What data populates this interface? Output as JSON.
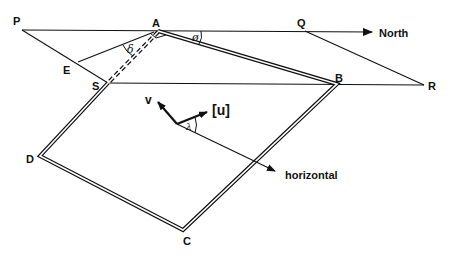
{
  "diagram": {
    "type": "geometry-orientation",
    "colors": {
      "stroke": "#111111",
      "background": "#ffffff"
    },
    "points": {
      "P": {
        "label": "P"
      },
      "A": {
        "label": "A"
      },
      "Q": {
        "label": "Q"
      },
      "R": {
        "label": "R"
      },
      "B": {
        "label": "B"
      },
      "S": {
        "label": "S"
      },
      "E": {
        "label": "E"
      },
      "D": {
        "label": "D"
      },
      "C": {
        "label": "C"
      }
    },
    "direction_labels": {
      "north": "North",
      "horizontal": "horizontal"
    },
    "vectors": {
      "v": "v",
      "u": "[u]"
    },
    "angles": {
      "phi": "ø",
      "delta": "δ",
      "lambda": "λ"
    }
  }
}
